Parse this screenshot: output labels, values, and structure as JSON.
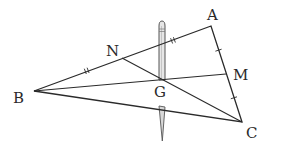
{
  "diagram": {
    "title": "",
    "colors": {
      "line": "#2a2a2a",
      "pencil_outline": "#555555",
      "pencil_fill": "#e6e6e6",
      "background": "#ffffff"
    },
    "points": {
      "A": {
        "label": "A",
        "x": 211,
        "y": 26
      },
      "B": {
        "label": "B",
        "x": 34,
        "y": 91
      },
      "C": {
        "label": "C",
        "x": 242,
        "y": 122
      },
      "M": {
        "label": "M",
        "x": 226,
        "y": 74
      },
      "N": {
        "label": "N",
        "x": 122,
        "y": 58
      },
      "G": {
        "label": "G",
        "x": 162,
        "y": 80
      }
    },
    "segments": [
      "AB",
      "BC",
      "CA",
      "BM",
      "CN"
    ],
    "equal_marks": [
      {
        "segment": "BN",
        "type": "double-tick"
      },
      {
        "segment": "NA",
        "type": "double-tick"
      },
      {
        "segment": "AM",
        "type": "single-tick"
      },
      {
        "segment": "MC",
        "type": "single-tick"
      }
    ],
    "object": {
      "name": "pencil",
      "description": "pencil balanced vertically through centroid G"
    }
  }
}
